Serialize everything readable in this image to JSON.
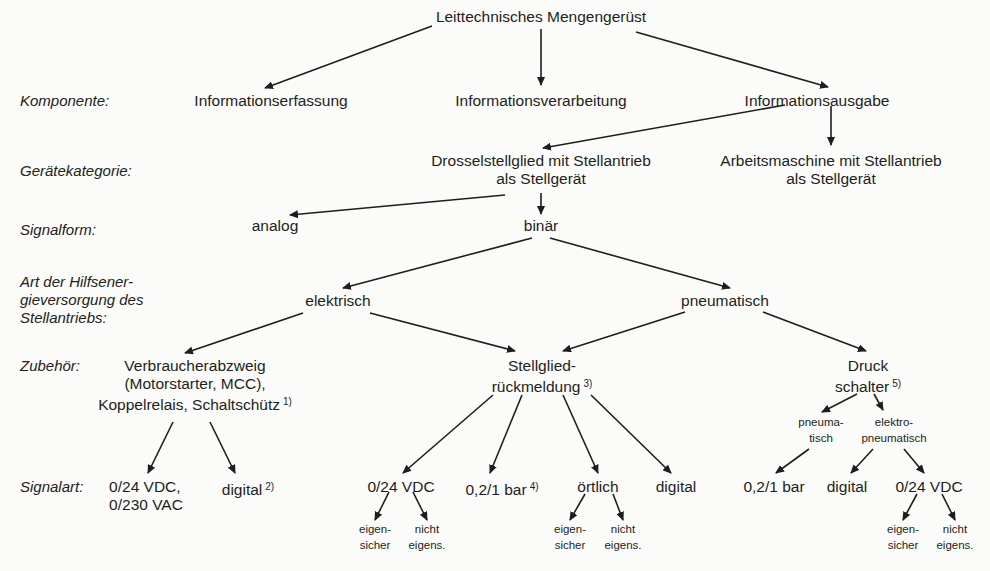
{
  "title": "Leittechnisches Mengengerüst",
  "row_labels": {
    "komponente": "Komponente:",
    "geraetekategorie": "Gerätekategorie:",
    "signalform": "Signalform:",
    "hilfsenergie": [
      "Art der Hilfsener-",
      "gieversorgung des",
      "Stellantriebs:"
    ],
    "zubehoer": "Zubehör:",
    "signalart": "Signalart:"
  },
  "komponenten": {
    "erfassung": "Informationserfassung",
    "verarbeitung": "Informationsverarbeitung",
    "ausgabe": "Informationsausgabe"
  },
  "geraetekategorien": {
    "drossel": [
      "Drosselstellglied mit Stellantrieb",
      "als Stellgerät"
    ],
    "arbeitsmaschine": [
      "Arbeitsmaschine mit Stellantrieb",
      "als Stellgerät"
    ]
  },
  "signalformen": {
    "analog": "analog",
    "binaer": "binär"
  },
  "hilfsenergie": {
    "elektrisch": "elektrisch",
    "pneumatisch": "pneumatisch"
  },
  "zubehoer": {
    "verbraucher": {
      "lines": [
        "Verbraucherabzweig",
        "(Motorstarter, MCC),",
        "Koppelrelais, Schaltschütz"
      ],
      "footnote": "1)"
    },
    "rueckmeldung": {
      "lines": [
        "Stellglied-",
        "rückmeldung"
      ],
      "footnote": "3)"
    },
    "druckschalter": {
      "lines": [
        "Druck",
        "schalter"
      ],
      "footnote": "5)",
      "sub": {
        "pneumatisch": [
          "pneuma-",
          "tisch"
        ],
        "elektropneumatisch": [
          "elektro-",
          "pneumatisch"
        ]
      }
    }
  },
  "signalarten": {
    "verbraucher": [
      {
        "lines": [
          "0/24 VDC,",
          "0/230 VAC"
        ]
      },
      {
        "text": "digital",
        "footnote": "2)"
      }
    ],
    "rueckmeldung": [
      {
        "text": "0/24 VDC",
        "sub": [
          [
            "eigen-",
            "sicher"
          ],
          [
            "nicht",
            "eigens."
          ]
        ]
      },
      {
        "text": "0,2/1 bar",
        "footnote": "4)"
      },
      {
        "text": "örtlich",
        "sub": [
          [
            "eigen-",
            "sicher"
          ],
          [
            "nicht",
            "eigens."
          ]
        ]
      },
      {
        "text": "digital"
      }
    ],
    "druckschalter": [
      {
        "text": "0,2/1 bar"
      },
      {
        "text": "digital"
      },
      {
        "text": "0/24 VDC",
        "sub": [
          [
            "eigen-",
            "sicher"
          ],
          [
            "nicht",
            "eigens."
          ]
        ]
      }
    ]
  },
  "colors": {
    "background": "#fbfbf9",
    "ink": "#1e1e1e"
  }
}
